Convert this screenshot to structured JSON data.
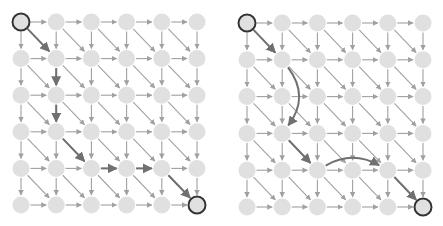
{
  "colors": {
    "background": "#ffffff",
    "node_fill": "#e0e0e0",
    "node_endpoint_stroke": "#333333",
    "edge": "#a0a0a0",
    "path_edge": "#707070"
  },
  "grid": {
    "rows": 6,
    "cols": 6,
    "node_radius": 8.5,
    "edges": [
      "right",
      "down",
      "diagonal-down-right"
    ]
  },
  "panels": [
    {
      "id": "left",
      "name": "grid-left",
      "origin": [
        21,
        22
      ],
      "spacing": [
        35.2,
        36.6
      ],
      "start": [
        0,
        0
      ],
      "end": [
        5,
        5
      ],
      "path": [
        {
          "from": [
            0,
            0
          ],
          "to": [
            1,
            1
          ],
          "type": "straight"
        },
        {
          "from": [
            1,
            1
          ],
          "to": [
            1,
            2
          ],
          "type": "straight"
        },
        {
          "from": [
            1,
            2
          ],
          "to": [
            1,
            3
          ],
          "type": "straight"
        },
        {
          "from": [
            1,
            3
          ],
          "to": [
            2,
            4
          ],
          "type": "straight"
        },
        {
          "from": [
            2,
            4
          ],
          "to": [
            3,
            4
          ],
          "type": "straight"
        },
        {
          "from": [
            3,
            4
          ],
          "to": [
            4,
            4
          ],
          "type": "straight"
        },
        {
          "from": [
            4,
            4
          ],
          "to": [
            5,
            5
          ],
          "type": "straight"
        }
      ]
    },
    {
      "id": "right",
      "name": "grid-right",
      "origin": [
        247,
        23
      ],
      "spacing": [
        35.2,
        36.8
      ],
      "start": [
        0,
        0
      ],
      "end": [
        5,
        5
      ],
      "path": [
        {
          "from": [
            0,
            0
          ],
          "to": [
            1,
            1
          ],
          "type": "straight"
        },
        {
          "from": [
            1,
            1
          ],
          "to": [
            1,
            3
          ],
          "type": "curve",
          "bend": -14
        },
        {
          "from": [
            1,
            3
          ],
          "to": [
            2,
            4
          ],
          "type": "straight"
        },
        {
          "from": [
            2,
            4
          ],
          "to": [
            4,
            4
          ],
          "type": "curve",
          "bend": -10
        },
        {
          "from": [
            4,
            4
          ],
          "to": [
            5,
            5
          ],
          "type": "straight"
        }
      ]
    }
  ]
}
